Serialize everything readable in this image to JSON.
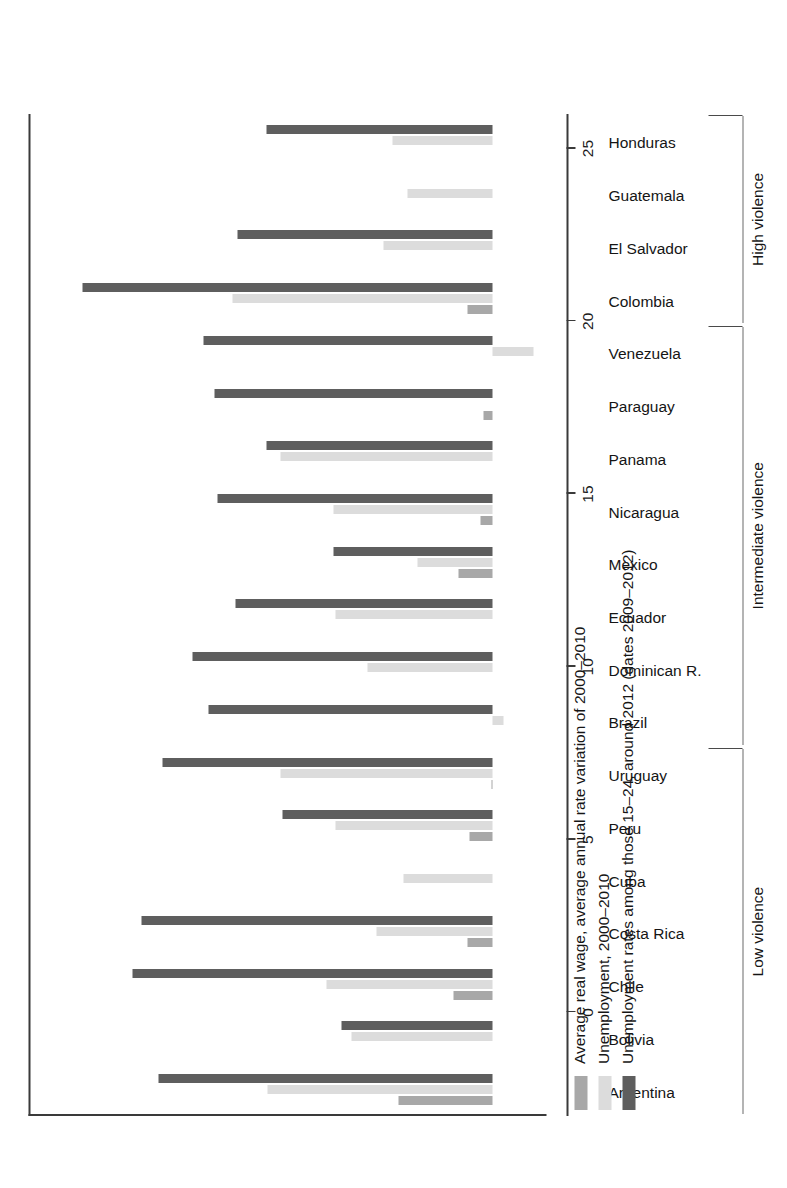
{
  "chart_data": {
    "type": "bar",
    "orientation": "vertical-rotated",
    "title": "",
    "xlabel": "",
    "ylabel": "",
    "ylim": [
      -3,
      26
    ],
    "grid": false,
    "legend_position": "below-axis",
    "value_ticks": [
      "0",
      "5",
      "10",
      "15",
      "20",
      "25"
    ],
    "value_tick_values": [
      0,
      5,
      10,
      15,
      20,
      25
    ],
    "categories": [
      "Argentina",
      "Bolivia",
      "Chile",
      "Costa Rica",
      "Cuba",
      "Peru",
      "Uruguay",
      "Brazil",
      "Dominican R.",
      "Ecuador",
      "Mexico",
      "Nicaragua",
      "Panama",
      "Paraguay",
      "Venezuela",
      "Colombia",
      "El Salvador",
      "Guatemala",
      "Honduras"
    ],
    "series": [
      {
        "name": "Average real wage, average annual rate variation of 2000–2010",
        "color": "#a8a8a8",
        "values": [
          5.3,
          0.0,
          2.2,
          1.4,
          0.0,
          1.3,
          0.1,
          0.0,
          0.0,
          0.0,
          1.9,
          0.7,
          0.0,
          0.5,
          0.0,
          1.4,
          0.0,
          0.0,
          0.0
        ]
      },
      {
        "name": "Unemployment, 2000–2010",
        "color": "#dcdcdc",
        "values": [
          12.6,
          7.9,
          9.3,
          6.5,
          5.0,
          8.8,
          11.9,
          -0.6,
          7.0,
          8.8,
          4.2,
          8.9,
          11.9,
          0.0,
          -2.3,
          14.6,
          6.1,
          4.8,
          5.6
        ]
      },
      {
        "name": "Unemployment rates among those 15–24, around 2012 (dates 2009–2012)",
        "color": "#5e5e5e",
        "values": [
          18.7,
          8.5,
          20.2,
          19.7,
          0.0,
          11.8,
          18.5,
          15.9,
          16.8,
          14.4,
          8.9,
          15.4,
          12.7,
          15.6,
          16.2,
          23.0,
          14.3,
          0.0,
          12.7
        ]
      }
    ],
    "negative_values_note": "Small negative values shown below the zero line for the Unemployment, 2000–2010 series.",
    "groups": [
      {
        "label": "Low violence",
        "from": "Argentina",
        "to": "Uruguay"
      },
      {
        "label": "Intermediate violence",
        "from": "Brazil",
        "to": "Venezuela"
      },
      {
        "label": "High violence",
        "from": "Colombia",
        "to": "Honduras"
      }
    ]
  },
  "legend": {
    "items": [
      {
        "label": "Average real wage, average annual rate variation of 2000–2010",
        "swatch": "#a8a8a8"
      },
      {
        "label": "Unemployment, 2000–2010",
        "swatch": "#dcdcdc"
      },
      {
        "label": "Unemployment rates among those 15–24, around 2012 (dates 2009–2012)",
        "swatch": "#5e5e5e"
      }
    ]
  },
  "colors": {
    "series_wage": "#a8a8a8",
    "series_unemployment": "#dcdcdc",
    "series_youth_unemployment": "#5e5e5e",
    "axis": "#3a3a3a",
    "text": "#151515",
    "background": "#ffffff"
  }
}
